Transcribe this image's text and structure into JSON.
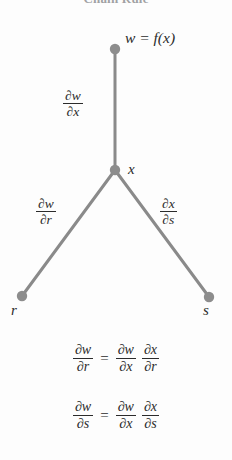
{
  "figure": {
    "title": "Chain Rule",
    "type": "chain-rule-tree-diagram"
  },
  "tree": {
    "nodes": [
      {
        "id": "w",
        "label": "w = f(x)",
        "x": 115,
        "y": 49
      },
      {
        "id": "x",
        "label": "x",
        "x": 115,
        "y": 170
      },
      {
        "id": "r",
        "label": "r",
        "x": 22,
        "y": 296
      },
      {
        "id": "s",
        "label": "s",
        "x": 209,
        "y": 297
      }
    ],
    "edges": [
      {
        "from": "w",
        "to": "x",
        "numerator": "∂w",
        "denominator": "∂x"
      },
      {
        "from": "x",
        "to": "r",
        "numerator": "∂w",
        "denominator": "∂r"
      },
      {
        "from": "x",
        "to": "s",
        "numerator": "∂x",
        "denominator": "∂s"
      }
    ]
  },
  "equations": [
    {
      "id": "eq-dw-dr",
      "left": {
        "numerator": "∂w",
        "denominator": "∂r"
      },
      "sign": "=",
      "right": [
        {
          "numerator": "∂w",
          "denominator": "∂x"
        },
        {
          "numerator": "∂x",
          "denominator": "∂r"
        }
      ]
    },
    {
      "id": "eq-dw-ds",
      "left": {
        "numerator": "∂w",
        "denominator": "∂s"
      },
      "sign": "=",
      "right": [
        {
          "numerator": "∂w",
          "denominator": "∂x"
        },
        {
          "numerator": "∂x",
          "denominator": "∂s"
        }
      ]
    }
  ],
  "style": {
    "background": "#fdfdfd",
    "edge_color": "#8a8a8a",
    "node_color": "#8d8d8d",
    "text_color": "#2b2b2b"
  }
}
